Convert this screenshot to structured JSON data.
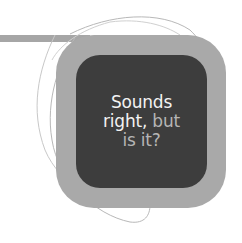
{
  "callout": {
    "line1": "Sounds",
    "line2_bright": "right,",
    "line2_dim": " but",
    "line3": "is it?"
  },
  "colors": {
    "connector": "#a6a6a6",
    "outer_box": "#a9a9a9",
    "inner_box": "#3d3d3d",
    "text_bright": "#f2f2f2",
    "text_dim": "#b5b5b5",
    "outline_stroke": "#b8b8b8"
  }
}
